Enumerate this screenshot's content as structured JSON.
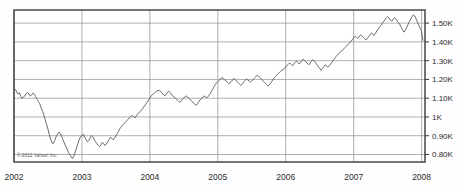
{
  "chart_data": {
    "type": "line",
    "title": "",
    "subtitle": "",
    "xlabel": "",
    "ylabel": "",
    "credit": "© 2012 Yahoo! Inc.",
    "grid": true,
    "legend": "none",
    "line_color": "#5a5a5a",
    "grid_color": "#9a9a9a",
    "frame_color": "#3a3a3a",
    "background_color": "#fefefe",
    "xlim": [
      2002.0,
      2008.05
    ],
    "ylim": [
      760,
      1570
    ],
    "x_tick_labels": [
      "2002",
      "2003",
      "2004",
      "2005",
      "2006",
      "2007",
      "2008"
    ],
    "x_tick_values": [
      2002,
      2003,
      2004,
      2005,
      2006,
      2007,
      2008
    ],
    "y_tick_labels": [
      "1.50K",
      "1.40K",
      "1.30K",
      "1.20K",
      "1.10K",
      "1K",
      "0.90K",
      "0.80K"
    ],
    "y_tick_values": [
      1500,
      1400,
      1300,
      1200,
      1100,
      1000,
      900,
      800
    ],
    "series": [
      {
        "name": "index",
        "x": [
          2002.0,
          2002.02,
          2002.04,
          2002.06,
          2002.08,
          2002.1,
          2002.12,
          2002.14,
          2002.16,
          2002.18,
          2002.2,
          2002.22,
          2002.24,
          2002.26,
          2002.28,
          2002.3,
          2002.32,
          2002.34,
          2002.36,
          2002.38,
          2002.4,
          2002.42,
          2002.44,
          2002.46,
          2002.48,
          2002.5,
          2002.52,
          2002.54,
          2002.56,
          2002.58,
          2002.6,
          2002.62,
          2002.64,
          2002.66,
          2002.68,
          2002.7,
          2002.72,
          2002.74,
          2002.76,
          2002.78,
          2002.8,
          2002.82,
          2002.84,
          2002.86,
          2002.88,
          2002.9,
          2002.92,
          2002.94,
          2002.96,
          2002.98,
          2003.0,
          2003.02,
          2003.04,
          2003.06,
          2003.08,
          2003.1,
          2003.12,
          2003.14,
          2003.16,
          2003.18,
          2003.2,
          2003.22,
          2003.24,
          2003.26,
          2003.28,
          2003.3,
          2003.32,
          2003.34,
          2003.36,
          2003.38,
          2003.4,
          2003.42,
          2003.44,
          2003.46,
          2003.48,
          2003.5,
          2003.52,
          2003.54,
          2003.56,
          2003.58,
          2003.6,
          2003.62,
          2003.64,
          2003.66,
          2003.68,
          2003.7,
          2003.72,
          2003.74,
          2003.76,
          2003.78,
          2003.8,
          2003.82,
          2003.84,
          2003.86,
          2003.88,
          2003.9,
          2003.92,
          2003.94,
          2003.96,
          2003.98,
          2004.0,
          2004.02,
          2004.04,
          2004.06,
          2004.08,
          2004.1,
          2004.12,
          2004.14,
          2004.16,
          2004.18,
          2004.2,
          2004.22,
          2004.24,
          2004.26,
          2004.28,
          2004.3,
          2004.32,
          2004.34,
          2004.36,
          2004.38,
          2004.4,
          2004.42,
          2004.44,
          2004.46,
          2004.48,
          2004.5,
          2004.52,
          2004.54,
          2004.56,
          2004.58,
          2004.6,
          2004.62,
          2004.64,
          2004.66,
          2004.68,
          2004.7,
          2004.72,
          2004.74,
          2004.76,
          2004.78,
          2004.8,
          2004.82,
          2004.84,
          2004.86,
          2004.88,
          2004.9,
          2004.92,
          2004.94,
          2004.96,
          2004.98,
          2005.0,
          2005.02,
          2005.04,
          2005.06,
          2005.08,
          2005.1,
          2005.12,
          2005.14,
          2005.16,
          2005.18,
          2005.2,
          2005.22,
          2005.24,
          2005.26,
          2005.28,
          2005.3,
          2005.32,
          2005.34,
          2005.36,
          2005.38,
          2005.4,
          2005.42,
          2005.44,
          2005.46,
          2005.48,
          2005.5,
          2005.52,
          2005.54,
          2005.56,
          2005.58,
          2005.6,
          2005.62,
          2005.64,
          2005.66,
          2005.68,
          2005.7,
          2005.72,
          2005.74,
          2005.76,
          2005.78,
          2005.8,
          2005.82,
          2005.84,
          2005.86,
          2005.88,
          2005.9,
          2005.92,
          2005.94,
          2005.96,
          2005.98,
          2006.0,
          2006.02,
          2006.04,
          2006.06,
          2006.08,
          2006.1,
          2006.12,
          2006.14,
          2006.16,
          2006.18,
          2006.2,
          2006.22,
          2006.24,
          2006.26,
          2006.28,
          2006.3,
          2006.32,
          2006.34,
          2006.36,
          2006.38,
          2006.4,
          2006.42,
          2006.44,
          2006.46,
          2006.48,
          2006.5,
          2006.52,
          2006.54,
          2006.56,
          2006.58,
          2006.6,
          2006.62,
          2006.64,
          2006.66,
          2006.68,
          2006.7,
          2006.72,
          2006.74,
          2006.76,
          2006.78,
          2006.8,
          2006.82,
          2006.84,
          2006.86,
          2006.88,
          2006.9,
          2006.92,
          2006.94,
          2006.96,
          2006.98,
          2007.0,
          2007.02,
          2007.04,
          2007.06,
          2007.08,
          2007.1,
          2007.12,
          2007.14,
          2007.16,
          2007.18,
          2007.2,
          2007.22,
          2007.24,
          2007.26,
          2007.28,
          2007.3,
          2007.32,
          2007.34,
          2007.36,
          2007.38,
          2007.4,
          2007.42,
          2007.44,
          2007.46,
          2007.48,
          2007.5,
          2007.52,
          2007.54,
          2007.56,
          2007.58,
          2007.6,
          2007.62,
          2007.64,
          2007.66,
          2007.68,
          2007.7,
          2007.72,
          2007.74,
          2007.76,
          2007.78,
          2007.8,
          2007.82,
          2007.84,
          2007.86,
          2007.88,
          2007.9,
          2007.92,
          2007.94,
          2007.96,
          2007.98,
          2008.0,
          2008.02
        ],
        "y": [
          1140,
          1148,
          1133,
          1122,
          1130,
          1110,
          1098,
          1108,
          1112,
          1125,
          1130,
          1122,
          1112,
          1118,
          1128,
          1122,
          1108,
          1095,
          1082,
          1070,
          1048,
          1030,
          1010,
          985,
          960,
          935,
          905,
          880,
          862,
          858,
          875,
          895,
          908,
          920,
          912,
          898,
          880,
          862,
          845,
          830,
          812,
          800,
          788,
          778,
          790,
          812,
          835,
          858,
          880,
          895,
          900,
          908,
          892,
          880,
          868,
          875,
          888,
          902,
          895,
          880,
          868,
          858,
          848,
          842,
          852,
          865,
          858,
          848,
          856,
          868,
          880,
          892,
          886,
          878,
          888,
          900,
          912,
          925,
          938,
          948,
          958,
          965,
          972,
          980,
          988,
          996,
          1002,
          1008,
          1002,
          995,
          1005,
          1015,
          1022,
          1030,
          1038,
          1048,
          1058,
          1068,
          1078,
          1090,
          1102,
          1112,
          1120,
          1126,
          1132,
          1138,
          1142,
          1140,
          1136,
          1128,
          1118,
          1112,
          1120,
          1132,
          1138,
          1130,
          1120,
          1112,
          1104,
          1098,
          1092,
          1086,
          1078,
          1085,
          1095,
          1102,
          1108,
          1112,
          1105,
          1098,
          1090,
          1082,
          1075,
          1068,
          1062,
          1070,
          1080,
          1092,
          1098,
          1104,
          1112,
          1108,
          1102,
          1110,
          1120,
          1132,
          1145,
          1158,
          1172,
          1182,
          1188,
          1195,
          1202,
          1210,
          1205,
          1198,
          1192,
          1185,
          1178,
          1182,
          1190,
          1198,
          1205,
          1198,
          1190,
          1182,
          1175,
          1168,
          1175,
          1185,
          1195,
          1202,
          1198,
          1192,
          1185,
          1192,
          1200,
          1208,
          1215,
          1222,
          1218,
          1210,
          1202,
          1195,
          1188,
          1180,
          1172,
          1165,
          1172,
          1182,
          1192,
          1202,
          1212,
          1220,
          1228,
          1235,
          1242,
          1248,
          1252,
          1258,
          1268,
          1275,
          1282,
          1288,
          1280,
          1272,
          1282,
          1292,
          1298,
          1290,
          1282,
          1292,
          1302,
          1308,
          1300,
          1292,
          1285,
          1278,
          1288,
          1298,
          1305,
          1298,
          1288,
          1278,
          1268,
          1258,
          1248,
          1258,
          1268,
          1278,
          1272,
          1265,
          1272,
          1282,
          1292,
          1302,
          1312,
          1322,
          1330,
          1338,
          1345,
          1352,
          1358,
          1365,
          1372,
          1380,
          1388,
          1395,
          1402,
          1412,
          1422,
          1430,
          1425,
          1418,
          1428,
          1438,
          1432,
          1425,
          1418,
          1410,
          1418,
          1428,
          1438,
          1448,
          1442,
          1435,
          1445,
          1458,
          1468,
          1478,
          1488,
          1498,
          1508,
          1518,
          1528,
          1535,
          1528,
          1518,
          1510,
          1520,
          1530,
          1522,
          1512,
          1502,
          1492,
          1478,
          1465,
          1452,
          1462,
          1478,
          1492,
          1508,
          1522,
          1535,
          1545,
          1538,
          1522,
          1505,
          1488,
          1472,
          1455,
          1408
        ]
      }
    ]
  }
}
